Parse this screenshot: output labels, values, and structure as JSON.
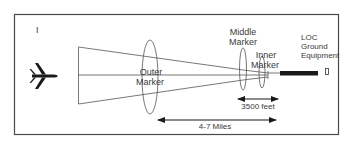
{
  "diagram": {
    "panel_label": "I",
    "aircraft_icon": "airplane-icon",
    "markers": {
      "outer": {
        "line1": "Outer",
        "line2": "Marker"
      },
      "middle": {
        "line1": "Middle",
        "line2": "Marker"
      },
      "inner": {
        "line1": "Inner",
        "line2": "Marker"
      }
    },
    "ground_equipment": {
      "line1": "LOC",
      "line2": "Ground",
      "line3": "Equipment"
    },
    "distances": {
      "middle_to_inner": "3500 feet",
      "outer_to_runway": "4-7 Miles"
    },
    "colors": {
      "line": "#555555",
      "runway": "#1a1a1a",
      "frame": "#4a4a4a",
      "text": "#3a3a3a"
    }
  }
}
